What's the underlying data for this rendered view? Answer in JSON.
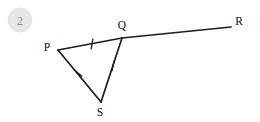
{
  "figure": {
    "badge": {
      "label": "2",
      "shape": "circle",
      "fill_color": "#e6e6e6",
      "text_color": "#8c8c8c",
      "cx": 20,
      "cy": 20,
      "r": 12
    },
    "background_color": "#ffffff",
    "stroke_color": "#1c1c1c",
    "points": {
      "P": {
        "x": 58,
        "y": 50,
        "label": "P",
        "label_x": 47,
        "label_y": 51
      },
      "Q": {
        "x": 122,
        "y": 38,
        "label": "Q",
        "label_x": 122,
        "label_y": 29
      },
      "R": {
        "x": 231,
        "y": 27,
        "label": "R",
        "label_x": 239,
        "label_y": 25
      },
      "S": {
        "x": 101,
        "y": 102,
        "label": "S",
        "label_x": 100,
        "label_y": 116
      }
    },
    "segments": [
      {
        "name": "PQ",
        "from": "P",
        "to": "Q",
        "ticks": 1
      },
      {
        "name": "QR",
        "from": "Q",
        "to": "R",
        "ticks": 0
      },
      {
        "name": "PS",
        "from": "P",
        "to": "S",
        "ticks": 1
      },
      {
        "name": "QS",
        "from": "Q",
        "to": "S",
        "ticks": 1
      }
    ],
    "tick_marks": [
      {
        "segment": "PQ",
        "cx": 92,
        "cy": 44,
        "angle_deg": 100,
        "length": 11
      },
      {
        "segment": "PS",
        "cx": 78,
        "cy": 73,
        "angle_deg": 40,
        "length": 11
      },
      {
        "segment": "QS",
        "cx": 113,
        "cy": 66,
        "angle_deg": 102,
        "length": 11
      }
    ]
  }
}
